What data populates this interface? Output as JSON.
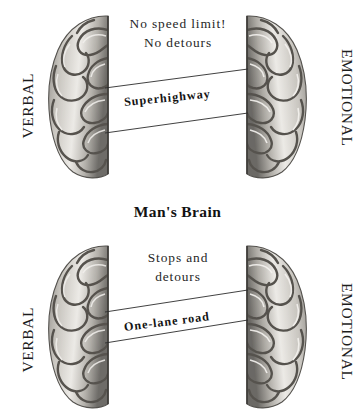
{
  "section_title": "Man's Brain",
  "colors": {
    "background": "#ffffff",
    "text": "#1a1a1a",
    "road_line": "#2b2b2b",
    "brain_light": "#e8e6e2",
    "brain_mid": "#9b9893",
    "brain_dark": "#4a4845"
  },
  "panels": [
    {
      "id": "top",
      "left_label": "VERBAL",
      "right_label": "EMOTIONAL",
      "caption_line1": "No speed limit!",
      "caption_line2": "No detours",
      "road_label": "Superhighway",
      "road_width": "wide",
      "left_brain_icon": "brain-hemisphere-left-icon",
      "right_brain_icon": "brain-hemisphere-right-icon"
    },
    {
      "id": "bottom",
      "left_label": "VERBAL",
      "right_label": "EMOTIONAL",
      "caption_line1": "Stops and",
      "caption_line2": "detours",
      "road_label": "One-lane road",
      "road_width": "narrow",
      "left_brain_icon": "brain-hemisphere-left-icon",
      "right_brain_icon": "brain-hemisphere-right-icon"
    }
  ]
}
